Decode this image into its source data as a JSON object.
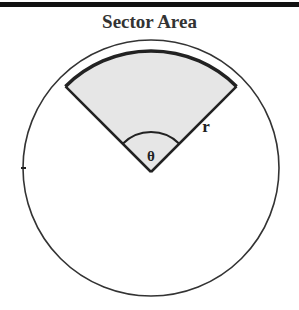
{
  "title": "Sector Area",
  "labels": {
    "angle": "θ",
    "radius": "r"
  },
  "sector": {
    "central_angle_degrees": 90,
    "fill_color": "#e6e6e6"
  },
  "colors": {
    "stroke": "#222222",
    "background": "#ffffff"
  }
}
